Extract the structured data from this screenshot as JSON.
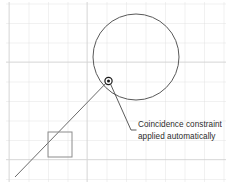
{
  "scene": {
    "kind": "cad-sketch-viewport",
    "width": 232,
    "height": 185,
    "background_color": "#ffffff"
  },
  "grid": {
    "name": "sketch-grid",
    "line_color": "#d8d8d8",
    "minor_line_color": "#ececec",
    "spacing_px": 19.5,
    "origin_x": 9,
    "origin_y": 3.5,
    "visible": true
  },
  "geometry": {
    "circle": {
      "label": "circle",
      "center_x": 136,
      "center_y": 57,
      "radius": 43,
      "stroke_color": "#595959",
      "stroke_width": 1.0
    },
    "line": {
      "label": "line",
      "x1": 15,
      "y1": 177,
      "x2": 110,
      "y2": 79,
      "stroke_color": "#6b6b6b",
      "stroke_width": 1.0
    },
    "square": {
      "label": "rectangle",
      "x": 48,
      "y": 132,
      "width": 24,
      "height": 25,
      "stroke_color": "#8c8c8c",
      "stroke_width": 1.0
    }
  },
  "constraint_marker": {
    "name": "coincidence-constraint-marker",
    "center_x": 108.5,
    "center_y": 81,
    "outer_radius": 3.6,
    "inner_radius": 1.5,
    "stroke_color": "#1a1a1a",
    "fill_color": "#1a1a1a"
  },
  "callout": {
    "leader": {
      "from_x": 110.5,
      "from_y": 84,
      "elbow_x": 131,
      "elbow_y": 130,
      "to_x": 136.5,
      "to_y": 130,
      "stroke_color": "#4a4a4a",
      "stroke_width": 0.9
    },
    "text_line_1": "Coincidence constraint",
    "text_line_2": "applied automatically",
    "text_color": "#2b2b2b"
  }
}
